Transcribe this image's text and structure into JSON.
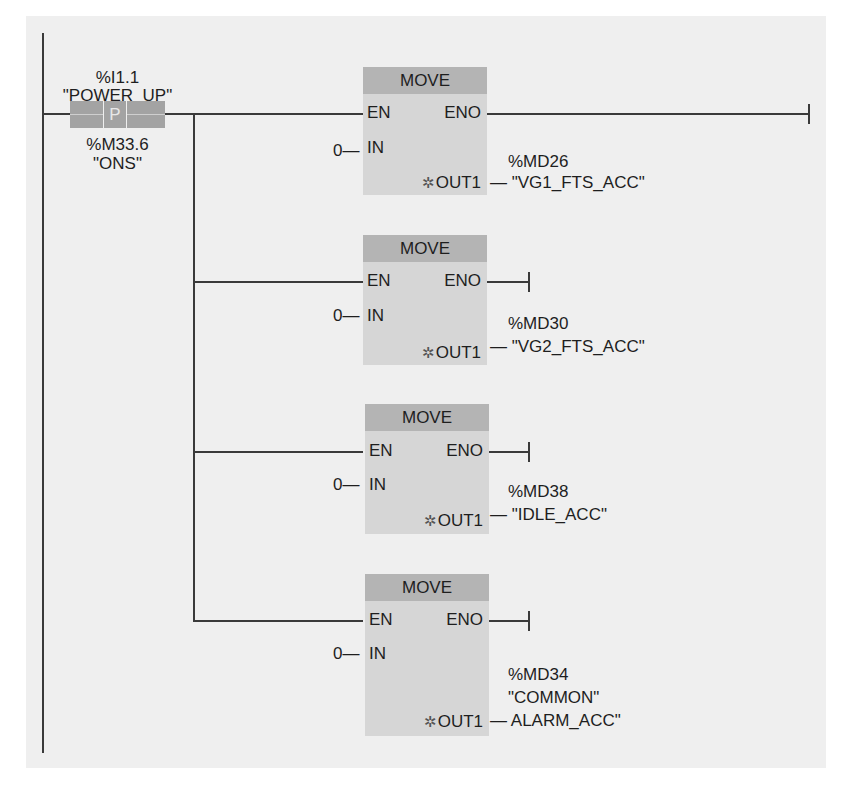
{
  "diagram": {
    "type": "ladder-logic",
    "power_rail": "left",
    "contact": {
      "address": "%I1.1",
      "tag": "\"POWER_UP\"",
      "symbol": "P",
      "edge_memory_address": "%M33.6",
      "edge_memory_tag": "\"ONS\""
    },
    "blocks": [
      {
        "title": "MOVE",
        "pins": {
          "en": "EN",
          "eno": "ENO",
          "in": "IN",
          "out": "OUT1"
        },
        "in_value": "0",
        "in_dash": "—",
        "out_address": "%MD26",
        "out_tag_line1": "\"VG1_FTS_ACC\"",
        "out_tag_line2": "",
        "eno_connection": "terminated-at-right-rail"
      },
      {
        "title": "MOVE",
        "pins": {
          "en": "EN",
          "eno": "ENO",
          "in": "IN",
          "out": "OUT1"
        },
        "in_value": "0",
        "in_dash": "—",
        "out_address": "%MD30",
        "out_tag_line1": "\"VG2_FTS_ACC\"",
        "out_tag_line2": "",
        "eno_connection": "open-terminated"
      },
      {
        "title": "MOVE",
        "pins": {
          "en": "EN",
          "eno": "ENO",
          "in": "IN",
          "out": "OUT1"
        },
        "in_value": "0",
        "in_dash": "—",
        "out_address": "%MD38",
        "out_tag_line1": "\"IDLE_ACC\"",
        "out_tag_line2": "",
        "eno_connection": "open-terminated"
      },
      {
        "title": "MOVE",
        "pins": {
          "en": "EN",
          "eno": "ENO",
          "in": "IN",
          "out": "OUT1"
        },
        "in_value": "0",
        "in_dash": "—",
        "out_address": "%MD34",
        "out_tag_line1": "\"COMMON\"",
        "out_tag_line2": "ALARM_ACC\"",
        "eno_connection": "open-terminated"
      }
    ],
    "out_pin_marker": "✲",
    "out_dash": "—",
    "colors": {
      "panel_background": "#efefef",
      "block_body": "#d6d6d6",
      "block_header": "#b4b4b4",
      "contact_fill": "#a3a3a3",
      "wire": "#3a3a3a"
    }
  }
}
